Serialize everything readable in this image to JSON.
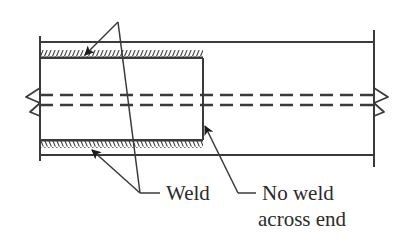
{
  "figure": {
    "type": "engineering-diagram",
    "width": 411,
    "height": 246,
    "background_color": "#ffffff",
    "line_color": "#3a3a3a",
    "text_color": "#2b2b2b"
  },
  "labels": {
    "weld": "Weld",
    "no_weld_line1": "No weld",
    "no_weld_line2": "across end"
  },
  "geometry": {
    "outer_pipe": {
      "top_line_y": 42,
      "bottom_line_y": 155,
      "left_x": 40,
      "right_x": 374
    },
    "inner_sleeve": {
      "left_x": 40,
      "right_end_x": 203,
      "top_y": 58,
      "bottom_y": 140
    },
    "weld_band_top": {
      "x_start": 40,
      "x_end": 203,
      "y": 57,
      "hatch_side": "above"
    },
    "weld_band_bottom": {
      "x_start": 40,
      "x_end": 203,
      "y": 141,
      "hatch_side": "below"
    },
    "centerline": {
      "upper_y": 95,
      "lower_y": 105,
      "dash_on": 13,
      "dash_off": 7
    },
    "break_symbol_left_x": 33,
    "break_symbol_right_x": 381
  },
  "annotations": [
    {
      "name": "weld-top-leader",
      "label_ref": "weld",
      "arrow_tip": [
        83,
        57
      ],
      "vertex": [
        118,
        22
      ]
    },
    {
      "name": "weld-bottom-leader",
      "label_ref": "weld",
      "arrow_tip": [
        90,
        148
      ],
      "vertex": [
        140,
        193
      ]
    },
    {
      "name": "no-weld-leader",
      "label_ref": "no_weld_line1",
      "arrow_tip": [
        203,
        123
      ],
      "vertex": [
        238,
        193
      ]
    }
  ],
  "text_positions": {
    "weld": [
      166,
      200
    ],
    "no_weld_line1": [
      262,
      200
    ],
    "no_weld_line2": [
      258,
      226
    ]
  }
}
